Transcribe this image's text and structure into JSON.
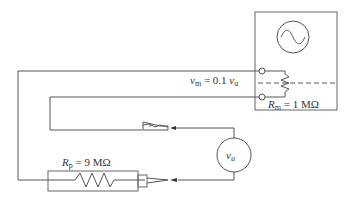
{
  "diagram": {
    "type": "circuit",
    "title": "",
    "oscilloscope": {
      "symbol": "sine-wave"
    },
    "labels": {
      "vm_equation": {
        "var": "v",
        "sub": "m",
        "rest": " = 0.1 ",
        "var2": "v",
        "sub2": "u"
      },
      "rm": {
        "var": "R",
        "sub": "m",
        "rest": " = 1 MΩ"
      },
      "rp": {
        "var": "R",
        "sub": "p",
        "rest": " = 9 MΩ"
      },
      "source": {
        "var": "v",
        "sub": "u"
      }
    },
    "components": [
      {
        "id": "oscilloscope",
        "kind": "instrument"
      },
      {
        "id": "Rm",
        "kind": "resistor",
        "value": "1 MΩ"
      },
      {
        "id": "Rp",
        "kind": "resistor",
        "value": "9 MΩ"
      },
      {
        "id": "vu",
        "kind": "voltage-source"
      },
      {
        "id": "ground-clip",
        "kind": "alligator-clip"
      },
      {
        "id": "probe-tip",
        "kind": "probe"
      }
    ]
  }
}
